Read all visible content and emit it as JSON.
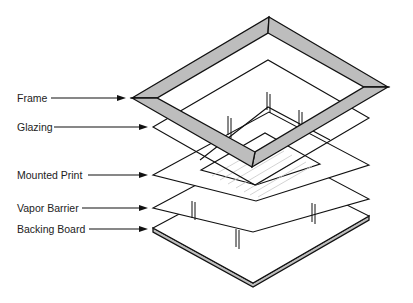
{
  "diagram": {
    "type": "exploded-view",
    "colors": {
      "line": "#111111",
      "frame_fill": "#bdbdbd",
      "board_edge": "#bdbdbd",
      "hatch": "#c8c8c8",
      "background": "#ffffff"
    },
    "labels": [
      {
        "id": "frame",
        "text": "Frame"
      },
      {
        "id": "glazing",
        "text": "Glazing"
      },
      {
        "id": "mounted_print",
        "text": "Mounted Print"
      },
      {
        "id": "vapor_barrier",
        "text": "Vapor Barrier"
      },
      {
        "id": "backing_board",
        "text": "Backing Board"
      }
    ]
  }
}
